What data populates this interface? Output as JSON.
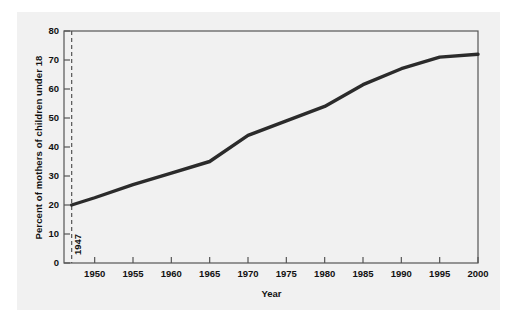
{
  "chart_data": {
    "type": "line",
    "title": "",
    "xlabel": "Year",
    "ylabel": "Percent of mothers of children under 18",
    "xlim": [
      1946,
      2000
    ],
    "ylim": [
      0,
      80
    ],
    "grid": false,
    "legend": null,
    "xticks": [
      "1950",
      "1955",
      "1960",
      "1965",
      "1970",
      "1975",
      "1980",
      "1985",
      "1990",
      "1995",
      "2000"
    ],
    "xtick_values": [
      1950,
      1955,
      1960,
      1965,
      1970,
      1975,
      1980,
      1985,
      1990,
      1995,
      2000
    ],
    "yticks": [
      "0",
      "10",
      "20",
      "30",
      "40",
      "50",
      "60",
      "70",
      "80"
    ],
    "ytick_values": [
      0,
      10,
      20,
      30,
      40,
      50,
      60,
      70,
      80
    ],
    "series": [
      {
        "name": "Percent of mothers of children under 18 in labor force",
        "color": "#2b2b2b",
        "x": [
          1947,
          1950,
          1955,
          1960,
          1965,
          1970,
          1975,
          1980,
          1985,
          1990,
          1995,
          2000
        ],
        "values": [
          20,
          22.5,
          27,
          31,
          35,
          44,
          49,
          54,
          61.5,
          67,
          71,
          72
        ]
      }
    ],
    "annotations": [
      {
        "label": "1947",
        "x": 1947,
        "type": "vertical-dashed-line",
        "color": "#555555",
        "orientation": "vertical-text"
      }
    ]
  }
}
